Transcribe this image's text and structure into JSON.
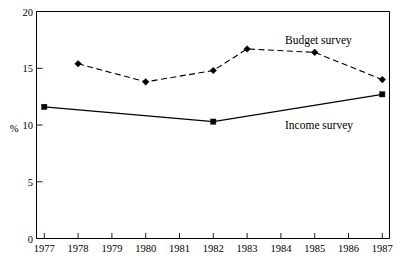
{
  "chart_data": {
    "type": "line",
    "title": "",
    "xlabel": "",
    "ylabel": "%",
    "x": [
      1977,
      1978,
      1979,
      1980,
      1981,
      1982,
      1983,
      1984,
      1985,
      1986,
      1987
    ],
    "xtick_labels": [
      "1977",
      "1978",
      "1979",
      "1980",
      "1981",
      "1982",
      "1983",
      "1984",
      "1985",
      "1986",
      "1987"
    ],
    "ytick_labels": [
      "0",
      "5",
      "10",
      "15",
      "20"
    ],
    "yticks": [
      0,
      5,
      10,
      15,
      20
    ],
    "ylim": [
      0,
      20
    ],
    "xlim": [
      1977,
      1987
    ],
    "grid": false,
    "legend_position": "inline-annotation",
    "series": [
      {
        "name": "Budget survey",
        "label": "Budget survey",
        "style": "dashed",
        "marker": "filled-diamond",
        "color": "#000000",
        "x": [
          1978,
          1980,
          1982,
          1983,
          1985,
          1987
        ],
        "values": [
          15.4,
          13.8,
          14.8,
          16.7,
          16.4,
          14.0
        ]
      },
      {
        "name": "Income survey",
        "label": "Income survey",
        "style": "solid",
        "marker": "filled-square",
        "color": "#000000",
        "x": [
          1977,
          1982,
          1987
        ],
        "values": [
          11.6,
          10.3,
          12.7
        ]
      }
    ],
    "annotations": [
      {
        "text": "Budget survey",
        "x": 1984.1,
        "y": 17.8
      },
      {
        "text": "Income survey",
        "x": 1984.1,
        "y": 10.5
      }
    ]
  },
  "axes": {
    "y_axis_title": "%",
    "y_max_label": "20",
    "y_min_label": "0"
  }
}
